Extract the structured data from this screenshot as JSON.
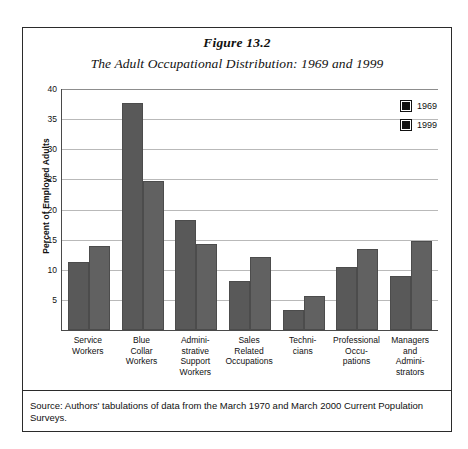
{
  "figure": {
    "number": "Figure 13.2",
    "subtitle": "The Adult Occupational Distribution: 1969 and 1999",
    "source_note": "Source: Authors' tabulations of data from the March 1970 and March 2000 Current Population Surveys."
  },
  "chart_data": {
    "type": "bar",
    "title": "The Adult Occupational Distribution: 1969 and 1999",
    "xlabel": "",
    "ylabel": "Percent of Employed Adults",
    "ylim": [
      0,
      40
    ],
    "yticks": [
      0,
      5,
      10,
      15,
      20,
      25,
      30,
      35,
      40
    ],
    "grid": true,
    "legend_position": "top-right",
    "categories": [
      "Service Workers",
      "Blue Collar Workers",
      "Administrative Support Workers",
      "Sales Related Occupations",
      "Technicians",
      "Professional Occupations",
      "Managers and Administrators"
    ],
    "category_label_lines": [
      [
        "Service",
        "Workers"
      ],
      [
        "Blue",
        "Collar",
        "Workers"
      ],
      [
        "Admini-",
        "strative",
        "Support",
        "Workers"
      ],
      [
        "Sales",
        "Related",
        "Occupations"
      ],
      [
        "Techni-",
        "cians"
      ],
      [
        "Professional",
        "Occu-",
        "pations"
      ],
      [
        "Managers",
        "and",
        "Admini-",
        "strators"
      ]
    ],
    "series": [
      {
        "name": "1969",
        "color": "#595959",
        "values": [
          11.3,
          37.6,
          18.2,
          8.2,
          3.3,
          10.4,
          9.0
        ]
      },
      {
        "name": "1999",
        "color": "#616161",
        "values": [
          13.9,
          24.8,
          14.3,
          12.2,
          5.7,
          13.5,
          14.7
        ]
      }
    ]
  },
  "legend": [
    {
      "label": "1969",
      "color": "#111111"
    },
    {
      "label": "1999",
      "color": "#111111"
    }
  ]
}
